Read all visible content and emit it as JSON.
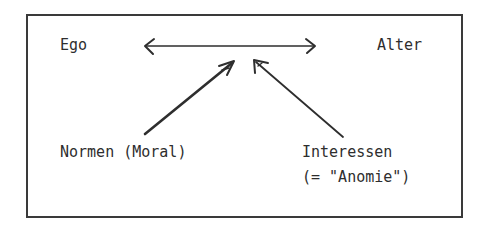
{
  "diagram": {
    "nodes": {
      "ego": "Ego",
      "alter": "Alter",
      "normen": "Normen (Moral)",
      "interessen_line1": "Interessen",
      "interessen_line2": "(= \"Anomie\")"
    },
    "edges": [
      {
        "from": "Ego",
        "to": "Alter",
        "type": "bidirectional"
      },
      {
        "from": "Normen (Moral)",
        "to": "Ego-Alter relation",
        "type": "directed"
      },
      {
        "from": "Interessen (= \"Anomie\")",
        "to": "Ego-Alter relation",
        "type": "directed"
      }
    ],
    "colors": {
      "ink": "#2e2e2e",
      "background": "#ffffff"
    }
  }
}
